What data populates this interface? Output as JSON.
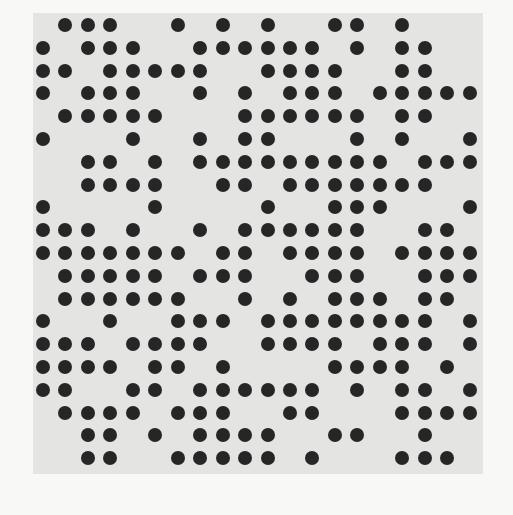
{
  "grid": {
    "rows": 20,
    "cols": 20,
    "dot_color": "#262626",
    "panel_color": "#e4e4e2",
    "background_color": "#f8f8f6",
    "filled": [
      [
        1,
        2,
        3,
        6,
        8,
        10,
        13,
        14,
        16
      ],
      [
        0,
        2,
        3,
        4,
        7,
        8,
        9,
        10,
        11,
        12,
        14,
        16,
        17
      ],
      [
        0,
        1,
        3,
        4,
        5,
        6,
        7,
        10,
        11,
        12,
        13,
        16,
        17
      ],
      [
        0,
        2,
        3,
        4,
        7,
        9,
        11,
        12,
        13,
        15,
        16,
        17,
        18,
        19
      ],
      [
        1,
        2,
        3,
        4,
        5,
        9,
        10,
        11,
        12,
        13,
        14,
        16,
        17
      ],
      [
        0,
        4,
        7,
        9,
        10,
        14,
        16,
        19
      ],
      [
        2,
        3,
        5,
        7,
        8,
        9,
        10,
        11,
        12,
        13,
        14,
        15,
        17,
        18,
        19
      ],
      [
        2,
        3,
        4,
        5,
        8,
        9,
        11,
        12,
        13,
        14,
        15,
        16,
        17
      ],
      [
        0,
        5,
        10,
        13,
        14,
        15,
        19
      ],
      [
        0,
        1,
        2,
        4,
        7,
        9,
        10,
        11,
        12,
        13,
        14,
        17,
        18
      ],
      [
        0,
        1,
        2,
        3,
        4,
        5,
        6,
        8,
        9,
        11,
        12,
        13,
        14,
        16,
        17,
        18,
        19
      ],
      [
        1,
        2,
        3,
        4,
        5,
        7,
        8,
        9,
        12,
        13,
        14,
        17,
        18,
        19
      ],
      [
        1,
        2,
        3,
        4,
        5,
        6,
        9,
        11,
        13,
        14,
        15,
        17,
        18
      ],
      [
        0,
        3,
        6,
        7,
        8,
        10,
        11,
        12,
        13,
        14,
        15,
        16,
        17,
        19
      ],
      [
        0,
        1,
        2,
        4,
        5,
        6,
        7,
        10,
        11,
        12,
        13,
        15,
        16,
        17,
        19
      ],
      [
        0,
        1,
        2,
        3,
        5,
        6,
        8,
        13,
        14,
        15,
        16,
        18
      ],
      [
        0,
        1,
        4,
        5,
        7,
        8,
        9,
        10,
        11,
        12,
        14,
        16,
        17,
        19
      ],
      [
        1,
        2,
        3,
        4,
        6,
        7,
        8,
        11,
        12,
        16,
        17,
        18,
        19
      ],
      [
        2,
        3,
        5,
        7,
        8,
        9,
        10,
        13,
        14,
        17
      ],
      [
        2,
        3,
        6,
        7,
        8,
        9,
        10,
        12,
        16,
        17,
        18
      ]
    ]
  }
}
